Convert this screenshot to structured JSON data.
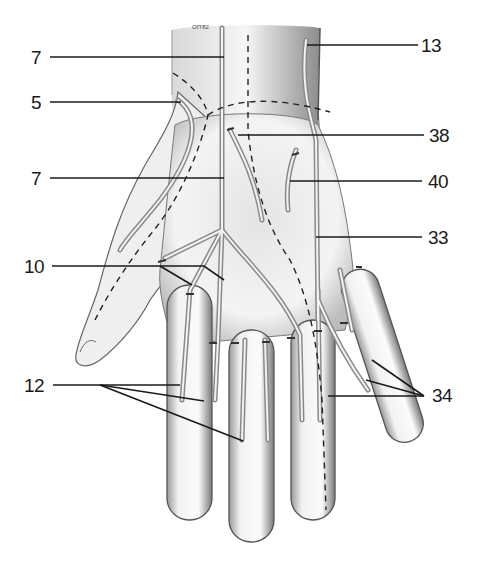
{
  "figure": {
    "signature": "ОП'82"
  },
  "labels": {
    "left": [
      {
        "id": "l7a",
        "text": "7",
        "x": 31,
        "y": 48
      },
      {
        "id": "l5",
        "text": "5",
        "x": 31,
        "y": 92
      },
      {
        "id": "l7b",
        "text": "7",
        "x": 31,
        "y": 170
      },
      {
        "id": "l10",
        "text": "10",
        "x": 24,
        "y": 257
      },
      {
        "id": "l12",
        "text": "12",
        "x": 24,
        "y": 377
      }
    ],
    "right": [
      {
        "id": "r13",
        "text": "13",
        "x": 420,
        "y": 36
      },
      {
        "id": "r38",
        "text": "38",
        "x": 423,
        "y": 126
      },
      {
        "id": "r40",
        "text": "40",
        "x": 423,
        "y": 172
      },
      {
        "id": "r33",
        "text": "33",
        "x": 423,
        "y": 228
      },
      {
        "id": "r34",
        "text": "34",
        "x": 432,
        "y": 385
      }
    ]
  },
  "colors": {
    "line": "#1a1a1a",
    "skin_shade": "#9a9a9a",
    "vein": "#7a7a7a",
    "background": "#ffffff"
  }
}
